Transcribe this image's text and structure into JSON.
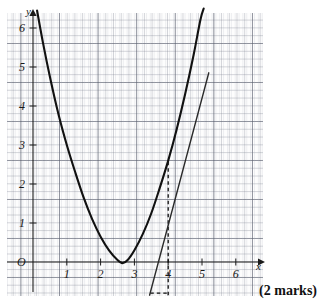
{
  "page": {
    "marks_note": "(2 marks)"
  },
  "chart_data": {
    "type": "line",
    "title": "",
    "xlabel": "x",
    "ylabel": "y",
    "grid": true,
    "legend": null,
    "xlim": [
      -0.37,
      6.25
    ],
    "ylim": [
      -0.9,
      6.4
    ],
    "xticks": [
      1,
      2,
      3,
      4,
      5,
      6
    ],
    "xtick_labels": [
      "1",
      "2",
      "3",
      "4",
      "5",
      "6"
    ],
    "yticks": [
      1,
      2,
      3,
      4,
      5,
      6
    ],
    "ytick_labels": [
      "1",
      "2",
      "3",
      "4",
      "5",
      "6"
    ],
    "origin_label": "O",
    "series": [
      {
        "name": "curve",
        "kind": "parabola",
        "style": "solid",
        "points": [
          [
            0.12,
            6.45
          ],
          [
            0.3,
            5.6
          ],
          [
            0.5,
            4.75
          ],
          [
            0.75,
            3.8
          ],
          [
            1.0,
            3.0
          ],
          [
            1.25,
            2.3
          ],
          [
            1.5,
            1.65
          ],
          [
            1.75,
            1.1
          ],
          [
            2.0,
            0.65
          ],
          [
            2.25,
            0.3
          ],
          [
            2.5,
            0.05
          ],
          [
            2.65,
            -0.03
          ],
          [
            2.8,
            0.05
          ],
          [
            3.0,
            0.3
          ],
          [
            3.25,
            0.72
          ],
          [
            3.5,
            1.25
          ],
          [
            3.75,
            1.9
          ],
          [
            4.0,
            2.6
          ],
          [
            4.25,
            3.4
          ],
          [
            4.5,
            4.3
          ],
          [
            4.75,
            5.3
          ],
          [
            4.95,
            6.2
          ],
          [
            5.05,
            6.5
          ]
        ]
      },
      {
        "name": "tangent-line",
        "kind": "straight",
        "style": "solid",
        "points": [
          [
            3.45,
            -0.85
          ],
          [
            5.2,
            4.85
          ]
        ]
      }
    ],
    "annotations": [
      {
        "name": "vertical-dashed-at-x-4",
        "kind": "dashed-vertical",
        "x": 4.0,
        "y_from": -0.85,
        "y_to": 2.6
      },
      {
        "name": "horizontal-dashed-baseline",
        "kind": "dashed-horizontal",
        "y": -0.8,
        "x_from": 3.47,
        "x_to": 4.0
      }
    ]
  }
}
